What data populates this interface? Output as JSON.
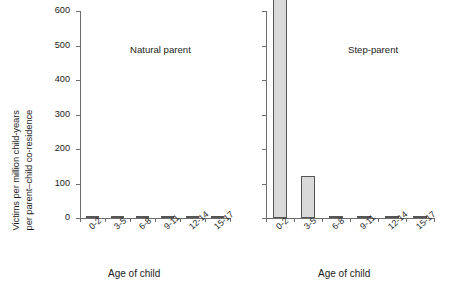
{
  "chart_data": {
    "type": "bar",
    "title": "",
    "subtitle": "",
    "ylabel_line1": "Victims per million child-years",
    "ylabel_line2": "per parent–child co-residence",
    "xlabel": "Age of child",
    "categories": [
      "0-2",
      "3-5",
      "6-8",
      "9-11",
      "12-14",
      "15-17"
    ],
    "ylim": [
      0,
      600
    ],
    "yticks": [
      0,
      100,
      200,
      300,
      400,
      500,
      600
    ],
    "ytick_labels": [
      "0",
      "100",
      "200",
      "300",
      "400",
      "500",
      "600"
    ],
    "grid": false,
    "legend": "none",
    "bar_fill": "#d9d9d9",
    "bar_edge": "#555555",
    "axis_color": "#6d6d6d",
    "panels": [
      {
        "name": "Natural parent",
        "xlabel": "Age of child",
        "show_ytick_labels": true,
        "series": [
          {
            "name": "Natural parent",
            "values": [
              6,
              5,
              4,
              0.6,
              0.6,
              0.6
            ]
          }
        ]
      },
      {
        "name": "Step-parent",
        "xlabel": "Age of child",
        "show_ytick_labels": false,
        "series": [
          {
            "name": "Step-parent",
            "values": [
              638,
              122,
              6,
              5,
              5,
              2
            ]
          }
        ]
      }
    ]
  }
}
